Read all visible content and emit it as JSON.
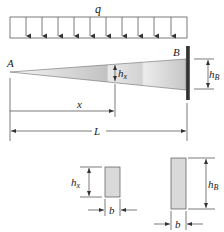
{
  "figure": {
    "type": "tapered cantilever beam with uniform load",
    "labels": {
      "load": "q",
      "free_end": "A",
      "fixed_end": "B",
      "height_at_x": "h",
      "height_at_x_sub": "x",
      "height_at_B": "h",
      "height_at_B_sub": "B",
      "distance_x": "x",
      "length": "L",
      "section_x_height": "h",
      "section_x_height_sub": "x",
      "section_x_width": "b",
      "section_B_height": "h",
      "section_B_height_sub": "B",
      "section_B_width": "b"
    },
    "load_arrow_count": 10,
    "colors": {
      "beam_light": "#f4f4f4",
      "beam_dark": "#b8b8b8",
      "wall": "#3a3a3a",
      "section_fill": "#d9d9d9",
      "line": "#333333"
    }
  }
}
